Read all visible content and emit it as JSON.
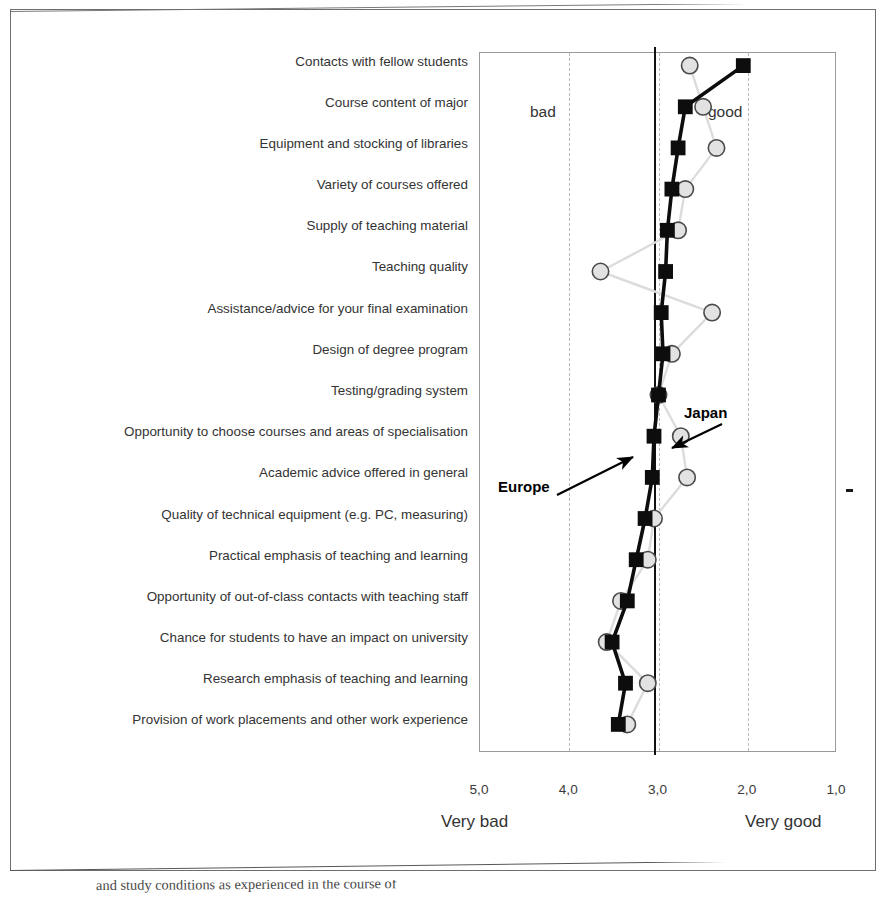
{
  "chart_data": {
    "type": "line",
    "title": "",
    "xlabel": "",
    "ylabel": "",
    "orientation": "horizontal",
    "xlim": [
      5.0,
      1.0
    ],
    "x_reversed": true,
    "xticks": [
      "5,0",
      "4,0",
      "3,0",
      "2,0",
      "1,0"
    ],
    "xtick_values": [
      5.0,
      4.0,
      3.0,
      2.0,
      1.0
    ],
    "grid": "vertical dashed at 4,0 / 3,0 / 2,0",
    "scale_low_label": "Very bad",
    "scale_high_label": "Very good",
    "inline_low_label": "bad",
    "inline_high_label": "good",
    "legend_position": "inline annotations with arrows",
    "reference_line_value": 3.05,
    "categories": [
      "Contacts with fellow students",
      "Course content of major",
      "Equipment and stocking of libraries",
      "Variety of courses offered",
      "Supply of teaching material",
      "Teaching quality",
      "Assistance/advice for your final examination",
      "Design of degree program",
      "Testing/grading system",
      "Opportunity to choose courses and areas of specialisation",
      "Academic advice offered in general",
      "Quality of technical equipment (e.g. PC, measuring)",
      "Practical emphasis of teaching and learning",
      "Opportunity of out-of-class contacts with teaching staff",
      "Chance for students to have an impact on university",
      "Research emphasis of teaching and learning",
      "Provision of work placements and other work experience"
    ],
    "series": [
      {
        "name": "Europe",
        "marker": "filled-square",
        "color": "#0d0d0d",
        "values": [
          2.05,
          2.7,
          2.78,
          2.85,
          2.9,
          2.92,
          2.97,
          2.95,
          3.0,
          3.05,
          3.07,
          3.15,
          3.25,
          3.35,
          3.52,
          3.37,
          3.45
        ]
      },
      {
        "name": "Japan",
        "marker": "open-circle",
        "color": "#d9d9d9",
        "values": [
          2.65,
          2.5,
          2.35,
          2.7,
          2.78,
          3.65,
          2.4,
          2.85,
          3.0,
          2.75,
          2.68,
          3.05,
          3.12,
          3.42,
          3.58,
          3.12,
          3.35
        ]
      }
    ],
    "annotations": [
      {
        "label": "Japan",
        "points_to_series": "Japan"
      },
      {
        "label": "Europe",
        "points_to_series": "Europe"
      }
    ]
  },
  "caption": {
    "text": "and study conditions as experienced in the course of"
  }
}
